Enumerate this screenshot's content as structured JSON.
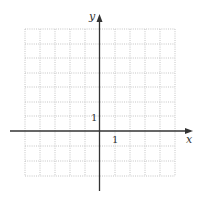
{
  "graph": {
    "x_label": "x",
    "y_label": "y",
    "x_tick_label": "1",
    "y_tick_label": "1",
    "x_range": [
      -5,
      5
    ],
    "y_range": [
      -3,
      7
    ],
    "grid_color": "#c8c8c8",
    "axis_color": "#333333"
  }
}
